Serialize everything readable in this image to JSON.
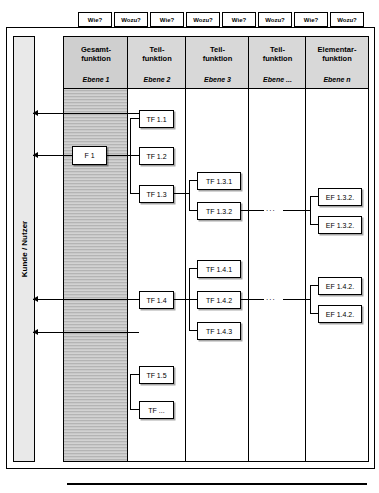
{
  "questions": {
    "top_labels": [
      "Wie?",
      "Wozu?",
      "Wie?",
      "Wozu?",
      "Wie?",
      "Wozu?",
      "Wie?",
      "Wozu?"
    ]
  },
  "side_label": "Kunde / Nutzer",
  "columns": [
    {
      "title": "Gesamt-\nfunktion",
      "level": "Ebene 1",
      "shaded": true
    },
    {
      "title": "Teil-\nfunktion",
      "level": "Ebene 2",
      "shaded": false
    },
    {
      "title": "Teil-\nfunktion",
      "level": "Ebene 3",
      "shaded": false
    },
    {
      "title": "Teil-\nfunktion",
      "level": "Ebene ...",
      "shaded": false
    },
    {
      "title": "Elementar-\nfunktion",
      "level": "Ebene n",
      "shaded": false
    }
  ],
  "boxes": {
    "col1": [
      "F 1"
    ],
    "col2": [
      "TF 1.1",
      "TF 1.2",
      "TF 1.3",
      "TF 1.4",
      "TF 1.5",
      "TF ..."
    ],
    "col3": [
      "TF 1.3.1",
      "TF 1.3.2",
      "TF 1.4.1",
      "TF 1.4.2",
      "TF 1.4.3"
    ],
    "col5": [
      "EF 1.3.2.",
      "EF 1.3.2.",
      "EF 1.4.2.",
      "EF 1.4.2."
    ]
  },
  "ellipsis": [
    "...",
    "..."
  ]
}
